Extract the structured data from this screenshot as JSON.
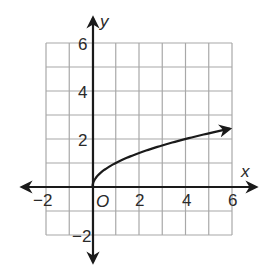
{
  "chart_data": {
    "type": "line",
    "title": "",
    "xlabel": "x",
    "ylabel": "y",
    "origin_label": "O",
    "xlim": [
      -2,
      6
    ],
    "ylim": [
      -2,
      6
    ],
    "grid": true,
    "grid_step": 1,
    "x_tick_labels": [
      "−2",
      "2",
      "4",
      "6"
    ],
    "y_tick_labels": [
      "6",
      "4",
      "2",
      "−2"
    ],
    "series": [
      {
        "name": "y = √x",
        "function": "sqrt(x)",
        "x": [
          0,
          0.25,
          0.5,
          1,
          2,
          3,
          4,
          5,
          5.9
        ],
        "y": [
          0,
          0.5,
          0.71,
          1,
          1.41,
          1.73,
          2,
          2.24,
          2.43
        ],
        "arrow_end": true
      }
    ],
    "colors": {
      "grid": "#a8a8a8",
      "axis": "#1a1a1a",
      "curve": "#1a1a1a"
    }
  }
}
